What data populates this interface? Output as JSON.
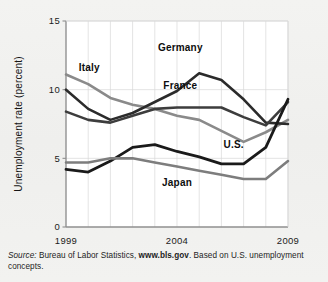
{
  "figure": {
    "background_color": "#f1f1ef",
    "plot_background_color": "#ffffff",
    "axis_color": "#8f8f8f",
    "grid_color": "#d9d9d9"
  },
  "source_note": {
    "prefix": "Source:",
    "agency": " Bureau of Labor Statistics, ",
    "link": "www.bls.gov",
    "suffix": ". Based on U.S. unemployment concepts."
  },
  "chart_data": {
    "type": "line",
    "title": "",
    "xlabel": "",
    "ylabel": "Unemployment rate (percent)",
    "xlim": [
      1999,
      2009
    ],
    "ylim": [
      0,
      15
    ],
    "yticks": [
      0,
      5,
      10,
      15
    ],
    "ytick_labels": [
      "0",
      "5",
      "10",
      "15"
    ],
    "xticks": [
      1999,
      2004,
      2009
    ],
    "xtick_labels": [
      "1999",
      "2004",
      "2009"
    ],
    "grid": "vertical-and-horizontal-light",
    "legend_position": "inline-labels",
    "x": [
      1999,
      2000,
      2001,
      2002,
      2003,
      2004,
      2005,
      2006,
      2007,
      2008,
      2009
    ],
    "series": [
      {
        "name": "Italy",
        "color": "#8a8a8a",
        "width": 2.6,
        "label": "Italy",
        "label_x": 2000.05,
        "label_y": 11.35,
        "values": [
          11.1,
          10.4,
          9.4,
          8.9,
          8.6,
          8.1,
          7.8,
          7.0,
          6.2,
          6.9,
          7.8
        ]
      },
      {
        "name": "Germany",
        "color": "#2b2b2b",
        "width": 2.6,
        "label": "Germany",
        "label_x": 2004.15,
        "label_y": 12.85,
        "values": [
          10.0,
          8.6,
          7.8,
          8.3,
          9.1,
          9.9,
          11.2,
          10.7,
          9.3,
          7.6,
          7.5
        ]
      },
      {
        "name": "France",
        "color": "#3d3d3d",
        "width": 2.6,
        "label": "France",
        "label_x": 2004.15,
        "label_y": 10.05,
        "values": [
          8.4,
          7.8,
          7.6,
          8.1,
          8.6,
          8.7,
          8.7,
          8.7,
          8.0,
          7.4,
          9.1
        ]
      },
      {
        "name": "U.S.",
        "color": "#1a1a1a",
        "width": 2.8,
        "label": "U.S.",
        "label_x": 2006.55,
        "label_y": 5.75,
        "values": [
          4.2,
          4.0,
          4.8,
          5.8,
          6.0,
          5.5,
          5.1,
          4.6,
          4.6,
          5.8,
          9.3
        ]
      },
      {
        "name": "Japan",
        "color": "#7d7d7d",
        "width": 2.6,
        "label": "Japan",
        "label_x": 2004.0,
        "label_y": 2.95,
        "values": [
          4.7,
          4.7,
          5.0,
          5.0,
          4.7,
          4.4,
          4.1,
          3.8,
          3.5,
          3.5,
          4.8
        ]
      }
    ]
  }
}
